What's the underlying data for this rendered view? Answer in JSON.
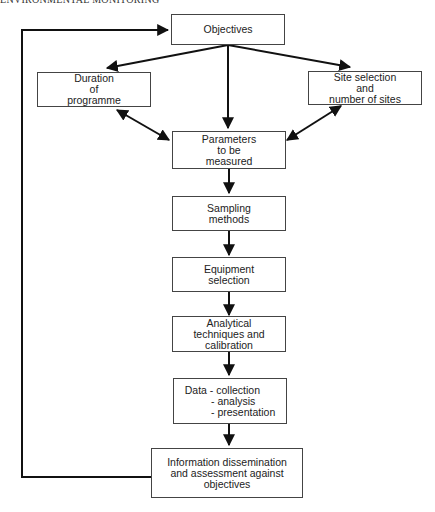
{
  "header": {
    "running_title": "ENVIRONMENTAL MONITORING"
  },
  "flowchart": {
    "nodes": {
      "objectives": {
        "label": "Objectives"
      },
      "duration": {
        "label": "Duration\nof\nprogramme"
      },
      "site_selection": {
        "label": "Site selection\nand\nnumber of sites"
      },
      "parameters": {
        "label": "Parameters\nto be\nmeasured"
      },
      "sampling": {
        "label": "Sampling\nmethods"
      },
      "equipment": {
        "label": "Equipment\nselection"
      },
      "analytical": {
        "label": "Analytical\ntechniques and\ncalibration"
      },
      "data": {
        "label": "Data - collection\n         - analysis\n         - presentation"
      },
      "information": {
        "label": "Information dissemination\nand assessment against\nobjectives"
      }
    },
    "edges": [
      {
        "from": "objectives",
        "to": "duration",
        "type": "arrow"
      },
      {
        "from": "objectives",
        "to": "parameters",
        "type": "arrow"
      },
      {
        "from": "objectives",
        "to": "site_selection",
        "type": "arrow"
      },
      {
        "from": "duration",
        "to": "parameters",
        "type": "double-arrow"
      },
      {
        "from": "site_selection",
        "to": "parameters",
        "type": "double-arrow"
      },
      {
        "from": "parameters",
        "to": "sampling",
        "type": "arrow"
      },
      {
        "from": "sampling",
        "to": "equipment",
        "type": "arrow"
      },
      {
        "from": "equipment",
        "to": "analytical",
        "type": "arrow"
      },
      {
        "from": "analytical",
        "to": "data",
        "type": "arrow"
      },
      {
        "from": "data",
        "to": "information",
        "type": "arrow"
      },
      {
        "from": "information",
        "to": "objectives",
        "type": "feedback-arrow"
      }
    ]
  }
}
